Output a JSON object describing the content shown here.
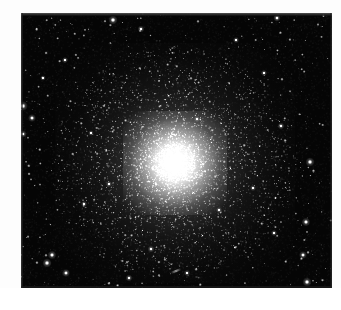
{
  "page": {
    "background_color": "#ffffff",
    "width": 341,
    "height": 310,
    "caption": ""
  },
  "plate": {
    "label": "globular-cluster-plate",
    "x": 21,
    "y": 13,
    "width": 311,
    "height": 275,
    "sky_color": "#050505",
    "star_color": "#ffffff",
    "edge_strip_color": "#6e6e6e",
    "description": "Black-sky astronomical photograph of a globular star cluster"
  },
  "cluster": {
    "name": "globular-cluster",
    "center_x": 154,
    "center_y": 150,
    "core_radius": 20,
    "halo_radius": 78,
    "outer_radius": 120,
    "core_color": "#ffffff",
    "halo_color": "#d8d8d8",
    "resolved_star_count": 5200
  },
  "field": {
    "name": "star-field",
    "background_star_count": 620,
    "bright_stars": [
      {
        "x": 92,
        "y": 7,
        "size": 3.0
      },
      {
        "x": 256,
        "y": 5,
        "size": 2.4
      },
      {
        "x": 2,
        "y": 93,
        "size": 3.2
      },
      {
        "x": 11,
        "y": 105,
        "size": 2.6
      },
      {
        "x": 2,
        "y": 121,
        "size": 2.4
      },
      {
        "x": 289,
        "y": 149,
        "size": 3.0
      },
      {
        "x": 285,
        "y": 209,
        "size": 2.8
      },
      {
        "x": 282,
        "y": 242,
        "size": 2.6
      },
      {
        "x": 286,
        "y": 269,
        "size": 3.0
      },
      {
        "x": 31,
        "y": 242,
        "size": 2.8
      },
      {
        "x": 26,
        "y": 250,
        "size": 3.0
      },
      {
        "x": 45,
        "y": 260,
        "size": 2.6
      },
      {
        "x": 108,
        "y": 265,
        "size": 2.2
      },
      {
        "x": 120,
        "y": 16,
        "size": 2.2
      },
      {
        "x": 215,
        "y": 27,
        "size": 2.0
      },
      {
        "x": 243,
        "y": 60,
        "size": 2.0
      },
      {
        "x": 260,
        "y": 113,
        "size": 2.2
      },
      {
        "x": 176,
        "y": 106,
        "size": 2.0
      },
      {
        "x": 63,
        "y": 191,
        "size": 2.0
      },
      {
        "x": 88,
        "y": 171,
        "size": 2.0
      },
      {
        "x": 130,
        "y": 236,
        "size": 2.2
      },
      {
        "x": 198,
        "y": 197,
        "size": 2.0
      },
      {
        "x": 232,
        "y": 175,
        "size": 2.0
      },
      {
        "x": 253,
        "y": 220,
        "size": 2.0
      },
      {
        "x": 166,
        "y": 260,
        "size": 2.0
      },
      {
        "x": 44,
        "y": 47,
        "size": 2.0
      },
      {
        "x": 22,
        "y": 65,
        "size": 1.8
      },
      {
        "x": 70,
        "y": 120,
        "size": 1.8
      }
    ],
    "streak": {
      "x": 155,
      "y": 258,
      "length": 11,
      "angle": -22
    }
  },
  "meta": {
    "image_type": "astronomical-photograph"
  }
}
